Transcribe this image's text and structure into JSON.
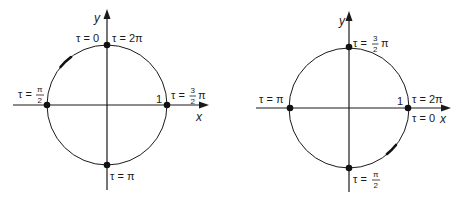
{
  "diagrams": [
    {
      "id": "left",
      "axes": {
        "x_label": "x",
        "y_label": "y"
      },
      "unit_label": "1",
      "direction": "counterclockwise",
      "points": {
        "top": {
          "left_text": "τ = 0",
          "right_text": "τ = 2π"
        },
        "left": {
          "prefix": "τ =",
          "num": "π",
          "den": "2"
        },
        "right": {
          "prefix": "τ =",
          "num": "3",
          "den": "2",
          "suffix": "π"
        },
        "bottom": {
          "text": "τ = π"
        }
      }
    },
    {
      "id": "right",
      "axes": {
        "x_label": "x",
        "y_label": "y"
      },
      "unit_label": "1",
      "direction": "clockwise",
      "points": {
        "top": {
          "prefix": "τ =",
          "num": "3",
          "den": "2",
          "suffix": "π"
        },
        "left": {
          "text": "τ = π"
        },
        "right": {
          "above_text": "τ = 2π",
          "below_text": "τ = 0"
        },
        "bottom": {
          "prefix": "τ =",
          "num": "π",
          "den": "2"
        }
      }
    }
  ],
  "colors": {
    "ink": "#1a1a1a",
    "background": "#ffffff"
  }
}
